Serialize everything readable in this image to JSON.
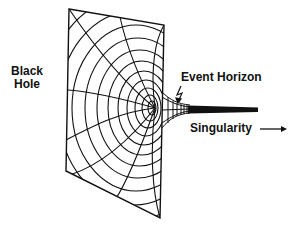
{
  "diagram": {
    "labels": {
      "black_hole_line1": "Black",
      "black_hole_line2": "Hole",
      "event_horizon": "Event Horizon",
      "singularity": "Singularity"
    },
    "icons": {
      "singularity_arrow": "arrow-right",
      "event_horizon_pointer": "zigzag-arrow"
    },
    "plane": {
      "corners": [
        [
          69,
          9
        ],
        [
          164,
          25
        ],
        [
          160,
          218
        ],
        [
          66,
          171
        ]
      ],
      "ring_center": [
        150,
        108
      ],
      "ring_count": 11
    },
    "funnel": {
      "mouth_x": 162,
      "throat_x": 186,
      "singularity_end_x": 258,
      "axis_y": 110
    },
    "colors": {
      "ink": "#111111",
      "background": "#ffffff"
    }
  }
}
